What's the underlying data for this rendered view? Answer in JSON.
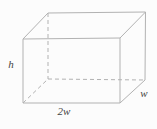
{
  "diagram": {
    "type": "rectangular-prism-wireframe",
    "canvas": {
      "width": 157,
      "height": 129,
      "background": "#fcfcfc"
    },
    "style": {
      "line_color": "#b2b2b2",
      "line_width": 1,
      "dash_pattern": "4 3",
      "label_color": "#444444",
      "label_font_size": 11
    },
    "vertices": {
      "front_top_left": [
        23,
        39
      ],
      "front_top_right": [
        120,
        38
      ],
      "front_bottom_right": [
        120,
        103
      ],
      "front_bottom_left": [
        23,
        103
      ],
      "back_top_left": [
        48,
        13
      ],
      "back_top_right": [
        145.5,
        12
      ],
      "back_bottom_right": [
        145,
        80
      ],
      "back_bottom_left": [
        48,
        79
      ]
    },
    "edges": [
      {
        "name": "front-top-edge",
        "from": "front_top_left",
        "to": "front_top_right",
        "hidden": false
      },
      {
        "name": "front-right-edge",
        "from": "front_top_right",
        "to": "front_bottom_right",
        "hidden": false
      },
      {
        "name": "front-bottom-edge",
        "from": "front_bottom_right",
        "to": "front_bottom_left",
        "hidden": false
      },
      {
        "name": "front-left-edge",
        "from": "front_bottom_left",
        "to": "front_top_left",
        "hidden": false
      },
      {
        "name": "top-left-depth-edge",
        "from": "front_top_left",
        "to": "back_top_left",
        "hidden": false
      },
      {
        "name": "top-back-edge",
        "from": "back_top_left",
        "to": "back_top_right",
        "hidden": false
      },
      {
        "name": "top-right-depth-edge",
        "from": "front_top_right",
        "to": "back_top_right",
        "hidden": false
      },
      {
        "name": "back-right-edge",
        "from": "back_top_right",
        "to": "back_bottom_right",
        "hidden": false
      },
      {
        "name": "bottom-right-depth-edge",
        "from": "front_bottom_right",
        "to": "back_bottom_right",
        "hidden": false
      },
      {
        "name": "back-left-edge",
        "from": "back_top_left",
        "to": "back_bottom_left",
        "hidden": true
      },
      {
        "name": "bottom-back-edge",
        "from": "back_bottom_left",
        "to": "back_bottom_right",
        "hidden": true
      },
      {
        "name": "bottom-left-depth-edge",
        "from": "front_bottom_left",
        "to": "back_bottom_left",
        "hidden": true
      }
    ],
    "labels": [
      {
        "name": "height-label",
        "text": "h",
        "x": 11,
        "y": 68,
        "anchor": "middle"
      },
      {
        "name": "base-width-label",
        "text": "2w",
        "x": 64,
        "y": 115,
        "anchor": "middle"
      },
      {
        "name": "depth-label",
        "text": "w",
        "x": 144,
        "y": 97,
        "anchor": "middle"
      }
    ]
  }
}
